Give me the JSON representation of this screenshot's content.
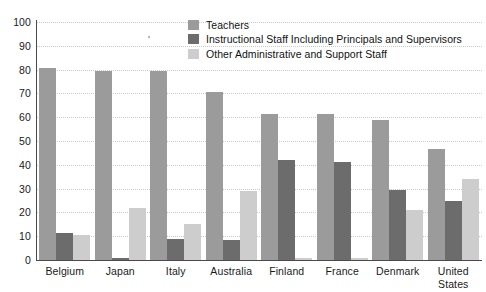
{
  "chart_data": {
    "type": "bar",
    "title": "",
    "xlabel": "",
    "ylabel": "",
    "ylim": [
      0,
      100
    ],
    "yticks": [
      0,
      10,
      20,
      30,
      40,
      50,
      60,
      70,
      80,
      90,
      100
    ],
    "grid": true,
    "legend_position": "top-center",
    "categories": [
      "Belgium",
      "Japan",
      "Italy",
      "Australia",
      "Finland",
      "France",
      "Denmark",
      "United States"
    ],
    "series": [
      {
        "name": "Teachers",
        "color": "#9b9b9b",
        "values": [
          80.5,
          79.5,
          79.5,
          70.5,
          61.5,
          61.5,
          59,
          46.5
        ]
      },
      {
        "name": "Instructional Staff Including Principals and Supervisors",
        "color": "#6c6c6c",
        "values": [
          11.5,
          1,
          9,
          8.5,
          42,
          41,
          29.5,
          25
        ]
      },
      {
        "name": "Other Administrative and Support Staff",
        "color": "#cdcdcd",
        "values": [
          10.5,
          22,
          15,
          29,
          1,
          1,
          21,
          34
        ]
      }
    ]
  },
  "axis": {
    "y_tick_labels": [
      "0",
      "10",
      "20",
      "30",
      "40",
      "50",
      "60",
      "70",
      "80",
      "90",
      "100"
    ]
  }
}
